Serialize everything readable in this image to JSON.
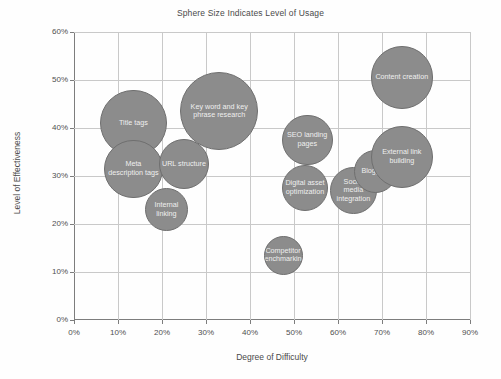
{
  "chart_data": {
    "type": "scatter",
    "title": "Sphere Size Indicates Level of Usage",
    "xlabel": "Degree of Difficulty",
    "ylabel": "Level of Effectiveness",
    "xlim": [
      0,
      90
    ],
    "ylim": [
      0,
      60
    ],
    "xticks": [
      "0%",
      "10%",
      "20%",
      "30%",
      "40%",
      "50%",
      "60%",
      "70%",
      "80%",
      "90%"
    ],
    "yticks": [
      "0%",
      "10%",
      "20%",
      "30%",
      "40%",
      "50%",
      "60%"
    ],
    "grid": true,
    "legend": "none",
    "bubble_color": "#8c8c8c",
    "bubble_border_color": "#6f6f6f",
    "label_color": "#efefef",
    "points": [
      {
        "label": "Title tags",
        "x": 13.5,
        "y": 41.0,
        "size": 17
      },
      {
        "label": "Meta description tags",
        "x": 13.5,
        "y": 31.5,
        "size": 15
      },
      {
        "label": "URL structure",
        "x": 25.0,
        "y": 32.5,
        "size": 13
      },
      {
        "label": "Internal linking",
        "x": 21.0,
        "y": 23.0,
        "size": 11
      },
      {
        "label": "Key word and key phrase research",
        "x": 33.0,
        "y": 43.5,
        "size": 20
      },
      {
        "label": "Competitor benchmarking",
        "x": 47.5,
        "y": 13.5,
        "size": 10
      },
      {
        "label": "SEO landing pages",
        "x": 53.0,
        "y": 37.5,
        "size": 13
      },
      {
        "label": "Digital asset optimization",
        "x": 52.5,
        "y": 27.5,
        "size": 12
      },
      {
        "label": "Social media integration",
        "x": 63.5,
        "y": 27.0,
        "size": 12
      },
      {
        "label": "Blogging",
        "x": 68.5,
        "y": 31.0,
        "size": 11
      },
      {
        "label": "External link building",
        "x": 74.5,
        "y": 34.0,
        "size": 16
      },
      {
        "label": "Content creation",
        "x": 74.5,
        "y": 50.5,
        "size": 16
      }
    ]
  }
}
